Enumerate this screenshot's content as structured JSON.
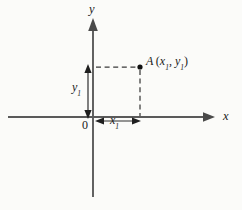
{
  "figure": {
    "kind": "cartesian-coordinate-diagram",
    "background_color": "#fbfbf9",
    "width": 242,
    "height": 210
  },
  "axes": {
    "x_label": "x",
    "y_label": "y",
    "origin_label": "0",
    "axis_color": "#5a5a5a",
    "x_axis": {
      "y": 117,
      "x_start": 8,
      "x_end": 215,
      "arrow": "right"
    },
    "y_axis": {
      "x": 93,
      "y_start": 20,
      "y_end": 197,
      "arrow": "up"
    }
  },
  "point": {
    "name": "A",
    "open_paren": "(",
    "coord_x_base": "x",
    "coord_x_sub": "1",
    "comma": ", ",
    "coord_y_base": "y",
    "coord_y_sub": "1",
    "close_paren": ")",
    "screen_x": 140,
    "screen_y": 67,
    "dot_color": "#111111"
  },
  "measures": {
    "horizontal": {
      "base": "x",
      "sub": "1",
      "from_x": 95,
      "to_x": 140,
      "y": 121
    },
    "vertical": {
      "base": "y",
      "sub": "1",
      "from_y": 67,
      "to_y": 116,
      "x": 88
    },
    "color": "#2e2e2e"
  },
  "guides": {
    "horizontal_dashed": {
      "x_start": 96,
      "x_end": 139,
      "y": 67
    },
    "vertical_dashed": {
      "x": 140,
      "y_start": 69,
      "y_end": 116
    },
    "color": "#3a3a3a"
  }
}
